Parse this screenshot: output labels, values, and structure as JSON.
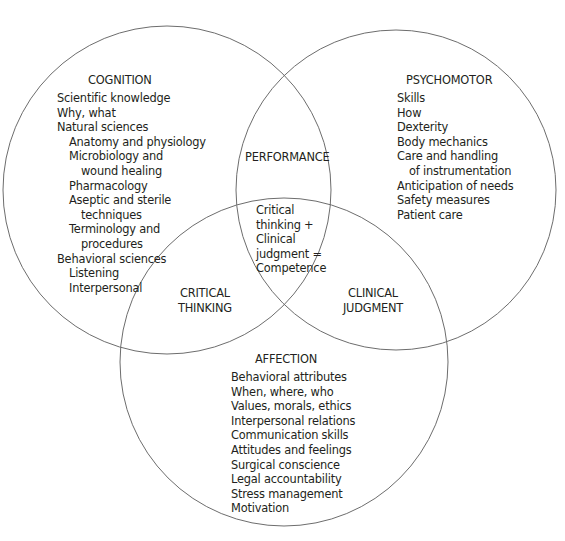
{
  "cognition": {
    "title": "COGNITION",
    "items": [
      {
        "text": "Scientific knowledge",
        "level": 0
      },
      {
        "text": "Why, what",
        "level": 0
      },
      {
        "text": "Natural sciences",
        "level": 0
      },
      {
        "text": "Anatomy and physiology",
        "level": 1
      },
      {
        "text": "Microbiology and",
        "level": 1
      },
      {
        "text": "wound healing",
        "level": 2
      },
      {
        "text": "Pharmacology",
        "level": 1
      },
      {
        "text": "Aseptic and sterile",
        "level": 1
      },
      {
        "text": "techniques",
        "level": 2
      },
      {
        "text": "Terminology and",
        "level": 1
      },
      {
        "text": "procedures",
        "level": 2
      },
      {
        "text": "Behavioral sciences",
        "level": 0
      },
      {
        "text": "Listening",
        "level": 1
      },
      {
        "text": "Interpersonal",
        "level": 1
      }
    ]
  },
  "psychomotor": {
    "title": "PSYCHOMOTOR",
    "items": [
      {
        "text": "Skills",
        "level": 0
      },
      {
        "text": "How",
        "level": 0
      },
      {
        "text": "Dexterity",
        "level": 0
      },
      {
        "text": "Body mechanics",
        "level": 0
      },
      {
        "text": "Care and handling",
        "level": 0
      },
      {
        "text": "of instrumentation",
        "level": 1
      },
      {
        "text": "Anticipation of needs",
        "level": 0
      },
      {
        "text": "Safety measures",
        "level": 0
      },
      {
        "text": "Patient care",
        "level": 0
      }
    ]
  },
  "affection": {
    "title": "AFFECTION",
    "items": [
      {
        "text": "Behavioral attributes",
        "level": 0
      },
      {
        "text": "When, where, who",
        "level": 0
      },
      {
        "text": "Values, morals, ethics",
        "level": 0
      },
      {
        "text": "Interpersonal relations",
        "level": 0
      },
      {
        "text": "Communication skills",
        "level": 0
      },
      {
        "text": "Attitudes and feelings",
        "level": 0
      },
      {
        "text": "Surgical conscience",
        "level": 0
      },
      {
        "text": "Legal accountability",
        "level": 0
      },
      {
        "text": "Stress management",
        "level": 0
      },
      {
        "text": "Motivation",
        "level": 0
      }
    ]
  },
  "intersections": {
    "performance": "PERFORMANCE",
    "critical_thinking": [
      "CRITICAL",
      "THINKING"
    ],
    "clinical_judgment": [
      "CLINICAL",
      "JUDGMENT"
    ],
    "center": [
      "Critical",
      "thinking +",
      "Clinical",
      "judgment =",
      "Competence"
    ]
  },
  "colors": {
    "stroke": "#6d6d6d",
    "text": "#231f20"
  }
}
